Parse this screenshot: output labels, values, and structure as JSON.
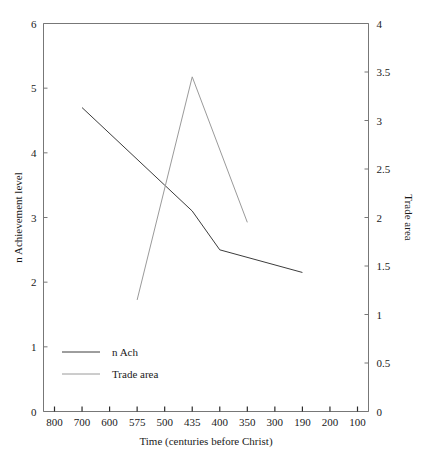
{
  "chart_data": {
    "type": "line",
    "title": "",
    "xlabel": "Time (centuries before Christ)",
    "ylabel": "n Achievement level",
    "y2label": "Trade area",
    "grid": false,
    "legend_position": "lower-left",
    "x_tick_labels": [
      "800",
      "700",
      "600",
      "575",
      "500",
      "435",
      "400",
      "350",
      "300",
      "190",
      "200",
      "100"
    ],
    "ylim": [
      0,
      6
    ],
    "y_tick_labels": [
      "0",
      "1",
      "2",
      "3",
      "4",
      "5",
      "6"
    ],
    "y2lim": [
      0,
      4
    ],
    "y2_tick_labels": [
      "0",
      "0.5",
      "1",
      "1.5",
      "2",
      "2.5",
      "3",
      "3.5",
      "4"
    ],
    "series": [
      {
        "name": "n Ach",
        "axis": "left",
        "color": "#3c3c3c",
        "points": [
          {
            "x_label": "700",
            "x_index": 1,
            "y": 4.7
          },
          {
            "x_label": "500",
            "x_index": 4,
            "y": 3.5
          },
          {
            "x_label": "435",
            "x_index": 5,
            "y": 3.1
          },
          {
            "x_label": "400",
            "x_index": 6,
            "y": 2.5
          },
          {
            "x_label": "190",
            "x_index": 9,
            "y": 2.15
          }
        ]
      },
      {
        "name": "Trade area",
        "axis": "right",
        "color": "#9a9a9a",
        "points": [
          {
            "x_label": "575",
            "x_index": 3,
            "y": 1.15
          },
          {
            "x_label": "435",
            "x_index": 5,
            "y": 3.45
          },
          {
            "x_label": "350",
            "x_index": 7,
            "y": 1.95
          }
        ]
      }
    ]
  },
  "legend": {
    "items": [
      {
        "label": "n Ach"
      },
      {
        "label": "Trade area"
      }
    ]
  },
  "colors": {
    "axis": "#777777",
    "text": "#1a1a1a",
    "series_n_ach": "#3c3c3c",
    "series_trade_area": "#9a9a9a",
    "background": "#ffffff"
  }
}
